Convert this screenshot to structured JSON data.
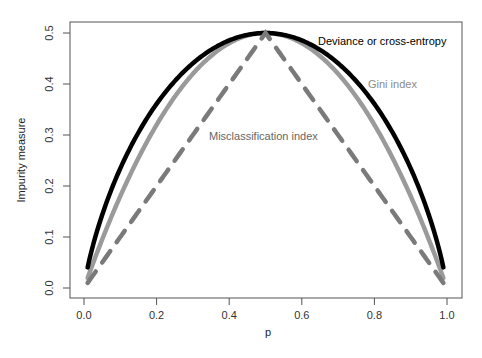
{
  "chart_data": {
    "type": "line",
    "title": "",
    "xlabel": "p",
    "ylabel": "Impurity measure",
    "xlim": [
      0.0,
      1.0
    ],
    "ylim": [
      0.0,
      0.5
    ],
    "grid": false,
    "legend": "none (inline annotations)",
    "x_ticks": [
      "0.0",
      "0.2",
      "0.4",
      "0.6",
      "0.8",
      "1.0"
    ],
    "y_ticks": [
      "0.0",
      "0.1",
      "0.2",
      "0.3",
      "0.4",
      "0.5"
    ],
    "x": [
      0.01,
      0.05,
      0.1,
      0.2,
      0.3,
      0.4,
      0.5,
      0.6,
      0.7,
      0.8,
      0.9,
      0.95,
      0.99
    ],
    "series": [
      {
        "name": "Deviance or cross-entropy",
        "style": "solid",
        "color": "#000000",
        "values": [
          0.04,
          0.143,
          0.234,
          0.361,
          0.441,
          0.485,
          0.5,
          0.485,
          0.441,
          0.361,
          0.234,
          0.143,
          0.04
        ]
      },
      {
        "name": "Gini index",
        "style": "solid",
        "color": "#999999",
        "values": [
          0.02,
          0.095,
          0.18,
          0.32,
          0.42,
          0.48,
          0.5,
          0.48,
          0.42,
          0.32,
          0.18,
          0.095,
          0.02
        ]
      },
      {
        "name": "Misclassification index",
        "style": "dashed",
        "color": "#808080",
        "values": [
          0.01,
          0.05,
          0.1,
          0.2,
          0.3,
          0.4,
          0.5,
          0.4,
          0.3,
          0.2,
          0.1,
          0.05,
          0.01
        ]
      }
    ],
    "annotations": [
      {
        "text": "Deviance or cross-entropy",
        "x": 0.86,
        "y": 0.472,
        "color": "#000000"
      },
      {
        "text": "Gini index",
        "x": 0.83,
        "y": 0.412,
        "color": "#8a8a8a"
      },
      {
        "text": "Misclassification index",
        "x": 0.52,
        "y": 0.313,
        "color": "#666666"
      }
    ]
  },
  "axes": {
    "xlabel": "p",
    "ylabel": "Impurity measure",
    "x_ticks": [
      "0.0",
      "0.2",
      "0.4",
      "0.6",
      "0.8",
      "1.0"
    ],
    "y_ticks": [
      "0.0",
      "0.1",
      "0.2",
      "0.3",
      "0.4",
      "0.5"
    ]
  },
  "labels": {
    "deviance": "Deviance or cross-entropy",
    "gini": "Gini index",
    "misclass": "Misclassification index"
  }
}
